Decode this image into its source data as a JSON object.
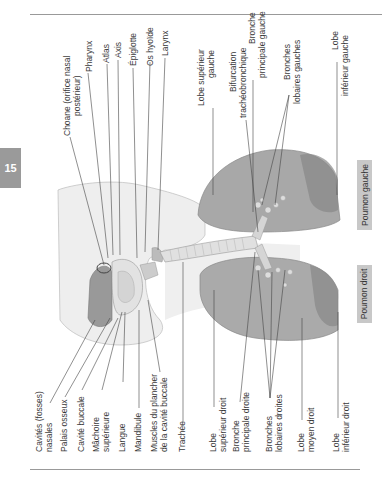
{
  "page": {
    "chapter_tab": "15"
  },
  "figure": {
    "top_labels": [
      {
        "id": "choane",
        "line1": "Choane (orifice nasal",
        "line2": "postérieur)"
      },
      {
        "id": "pharynx",
        "line1": "Pharynx",
        "line2": ""
      },
      {
        "id": "atlas",
        "line1": "Atlas",
        "line2": ""
      },
      {
        "id": "axis",
        "line1": "Axis",
        "line2": ""
      },
      {
        "id": "epiglotte",
        "line1": "Épiglotte",
        "line2": ""
      },
      {
        "id": "os-hyoide",
        "line1": "Os hyoïde",
        "line2": ""
      },
      {
        "id": "larynx",
        "line1": "Larynx",
        "line2": ""
      },
      {
        "id": "lobe-sup-gauche",
        "line1": "Lobe supérieur",
        "line2": "gauche"
      },
      {
        "id": "bifurcation",
        "line1": "Bifurcation",
        "line2": "trachéobronchique"
      },
      {
        "id": "bronche-princ-gauche",
        "line1": "Bronche",
        "line2": "principale gauche"
      },
      {
        "id": "bronches-lob-gauches",
        "line1": "Bronches",
        "line2": "lobaires gauches"
      },
      {
        "id": "lobe-inf-gauche",
        "line1": "Lobe",
        "line2": "inférieur gauche"
      }
    ],
    "bottom_labels": [
      {
        "id": "cavites-nasales",
        "line1": "Cavités (fosses)",
        "line2": "nasales"
      },
      {
        "id": "palais-osseux",
        "line1": "Palais osseux",
        "line2": ""
      },
      {
        "id": "cavite-buccale",
        "line1": "Cavité buccale",
        "line2": ""
      },
      {
        "id": "machoire-sup",
        "line1": "Mâchoire",
        "line2": "supérieure"
      },
      {
        "id": "langue",
        "line1": "Langue",
        "line2": ""
      },
      {
        "id": "mandibule",
        "line1": "Mandibule",
        "line2": ""
      },
      {
        "id": "muscles-plancher",
        "line1": "Muscles du plancher",
        "line2": "de la cavité buccale"
      },
      {
        "id": "trachee",
        "line1": "Trachée",
        "line2": ""
      },
      {
        "id": "lobe-sup-droit",
        "line1": "Lobe",
        "line2": "supérieur droit"
      },
      {
        "id": "bronche-princ-droite",
        "line1": "Bronche",
        "line2": "principale droite"
      },
      {
        "id": "bronches-lob-droites",
        "line1": "Bronches",
        "line2": "lobaires droites"
      },
      {
        "id": "lobe-moyen-droit",
        "line1": "Lobe",
        "line2": "moyen droit"
      },
      {
        "id": "lobe-inf-droit",
        "line1": "Lobe",
        "line2": "inférieur droit"
      }
    ],
    "region_boxes": {
      "left_lung": "Poumon gauche",
      "right_lung": "Poumon droit"
    }
  }
}
